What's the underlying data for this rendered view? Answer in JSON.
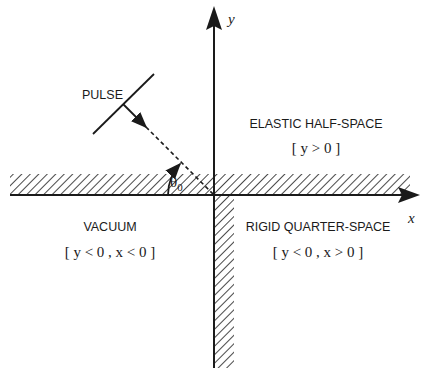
{
  "axes": {
    "x_label": "x",
    "y_label": "y"
  },
  "pulse": {
    "label": "PULSE"
  },
  "angle": {
    "symbol": "θ",
    "subscript": "0"
  },
  "regions": {
    "elastic": {
      "name": "ELASTIC HALF-SPACE",
      "condition": "[ y > 0 ]"
    },
    "vacuum": {
      "name": "VACUUM",
      "condition": "[ y < 0 ,  x < 0 ]"
    },
    "rigid": {
      "name": "RIGID QUARTER-SPACE",
      "condition": "[ y < 0 , x > 0 ]"
    }
  },
  "colors": {
    "ink": "#1a1a1a",
    "background": "#ffffff"
  }
}
